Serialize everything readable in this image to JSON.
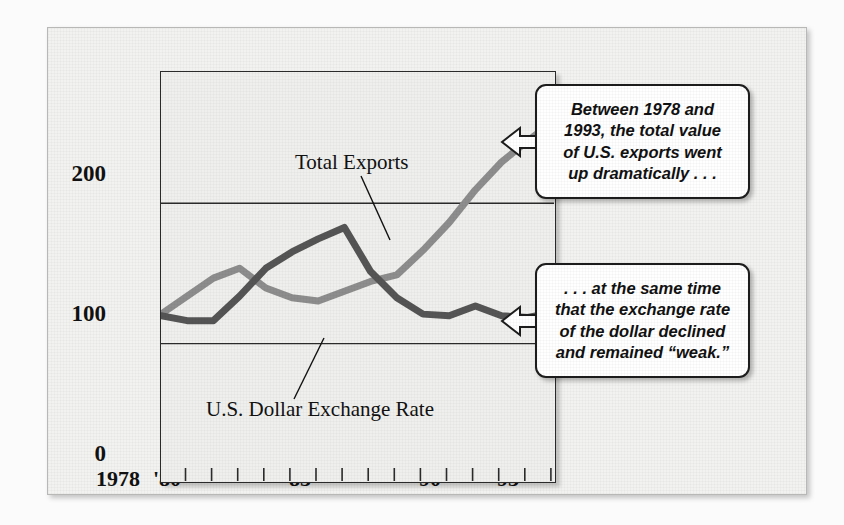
{
  "figure": {
    "background_color": "#f2f2f0",
    "plot_background_color": "#efefed"
  },
  "chart_data": {
    "type": "line",
    "title": "",
    "xlabel": "",
    "ylabel": "",
    "grid": "horizontal gridlines at 100 and 200",
    "legend": "inline series labels with leader lines",
    "xlim": [
      1978,
      1993
    ],
    "ylim": [
      0,
      250
    ],
    "yticks": [
      0,
      100,
      200
    ],
    "ytick_labels": [
      "0",
      "100",
      "200"
    ],
    "x": [
      1978,
      1979,
      1980,
      1981,
      1982,
      1983,
      1984,
      1985,
      1986,
      1987,
      1988,
      1989,
      1990,
      1991,
      1992,
      1993
    ],
    "xtick_labels": [
      "1978",
      "'80",
      "'85",
      "'90",
      "'93"
    ],
    "xtick_label_years": [
      1978,
      1980,
      1985,
      1990,
      1993
    ],
    "series": [
      {
        "name": "Total Exports",
        "color": "#8d8d8d",
        "values": [
          102,
          113,
          124,
          130,
          118,
          112,
          110,
          116,
          122,
          126,
          141,
          158,
          178,
          195,
          208,
          220
        ]
      },
      {
        "name": "U.S. Dollar Exchange Rate",
        "color": "#555555",
        "values": [
          101,
          98,
          98,
          113,
          130,
          140,
          148,
          155,
          128,
          112,
          102,
          101,
          107,
          101,
          100,
          103
        ]
      }
    ],
    "annotations": [
      {
        "id": "exports-label",
        "text": "Total Exports",
        "points_to_series": "Total Exports"
      },
      {
        "id": "dollar-label",
        "text": "U.S. Dollar Exchange Rate",
        "points_to_series": "U.S. Dollar Exchange Rate"
      }
    ]
  },
  "callouts": [
    {
      "id": "exports-callout",
      "text": "Between 1978 and\n1993, the total value\nof U.S. exports went\nup dramatically . . .",
      "arrow_direction": "left",
      "points_to": "Total Exports"
    },
    {
      "id": "dollar-callout",
      "text": ". . . at the same time\nthat the exchange rate\nof the dollar declined\nand remained “weak.”",
      "arrow_direction": "left",
      "points_to": "U.S. Dollar Exchange Rate"
    }
  ]
}
